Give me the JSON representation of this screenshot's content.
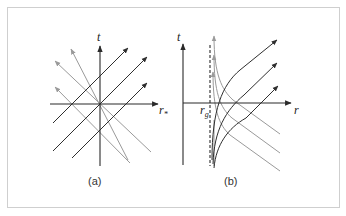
{
  "figure": {
    "panels": [
      {
        "id": "a",
        "caption": "(a)",
        "axes": {
          "vertical_label": "t",
          "horizontal_label": "r",
          "horizontal_label_sub": "*"
        },
        "description": "Flat light cones: straight outgoing and ingoing null rays at 45 degrees"
      },
      {
        "id": "b",
        "caption": "(b)",
        "axes": {
          "vertical_label": "t",
          "horizontal_label": "r"
        },
        "marker_label": "r",
        "marker_label_sub": "g",
        "description": "Null rays curving near the gravitational radius (dashed vertical line)"
      }
    ],
    "colors": {
      "frame": "#cfcfcf",
      "axis": "#2a2a2a",
      "outgoing_ray": "#2f2f2f",
      "ingoing_ray": "#9a9a9a"
    }
  }
}
